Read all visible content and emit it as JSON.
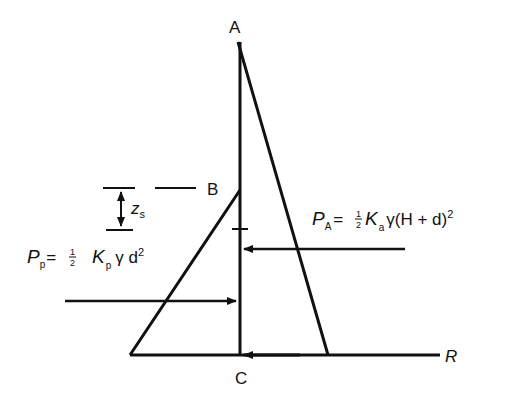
{
  "diagram": {
    "type": "earth-pressure-diagram",
    "points": {
      "A": "A",
      "B": "B",
      "C": "C"
    },
    "resultant_label": "R",
    "depth_label": {
      "symbol": "z",
      "subscript": "s"
    },
    "active_force": {
      "lhs": "P",
      "lhs_sub": "A",
      "eq": "=",
      "frac_num": "1",
      "frac_den": "2",
      "coef": "K",
      "coef_sub": "a",
      "body": "γ(H  +  d)",
      "exp": "2"
    },
    "passive_force": {
      "lhs": "P",
      "lhs_sub": "p",
      "eq": "=",
      "frac_num": "1",
      "frac_den": "2",
      "coef": "K",
      "coef_sub": "p",
      "body": "γ d",
      "exp": "2"
    },
    "colors": {
      "line": "#111111",
      "background": "#ffffff"
    }
  }
}
